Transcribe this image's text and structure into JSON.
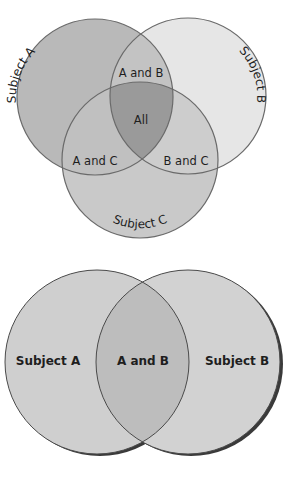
{
  "three_set_diagram": {
    "circles": [
      {
        "id": "A",
        "label": "Subject A",
        "cx": 95,
        "cy": 97,
        "r": 78,
        "fill": "#b9b9b9"
      },
      {
        "id": "B",
        "label": "Subject B",
        "cx": 188,
        "cy": 96,
        "r": 78,
        "fill": "#e6e6e6"
      },
      {
        "id": "C",
        "label": "Subject C",
        "cx": 140,
        "cy": 160,
        "r": 78,
        "fill": "#c9c9c9"
      }
    ],
    "regions": {
      "ab": "A and B",
      "ac": "A and C",
      "bc": "B and C",
      "all": "All"
    },
    "colors": {
      "outline": "#6a6a6a",
      "ab_fill": "#c3c3c3",
      "ac_fill": "#c0c0c0",
      "bc_fill": "#cdcdcd",
      "all_fill": "#9a9a9a"
    }
  },
  "two_set_diagram": {
    "circles": [
      {
        "id": "A",
        "label": "Subject A",
        "cx": 97,
        "cy": 362,
        "r": 92,
        "fill": "#cfcfcf"
      },
      {
        "id": "B",
        "label": "Subject B",
        "cx": 188,
        "cy": 362,
        "r": 92,
        "fill": "#d2d2d2"
      }
    ],
    "regions": {
      "ab": "A and B"
    },
    "colors": {
      "outline": "#4a4a4a",
      "ab_fill": "#bdbdbd",
      "shadow": "#3a3a3a"
    }
  }
}
